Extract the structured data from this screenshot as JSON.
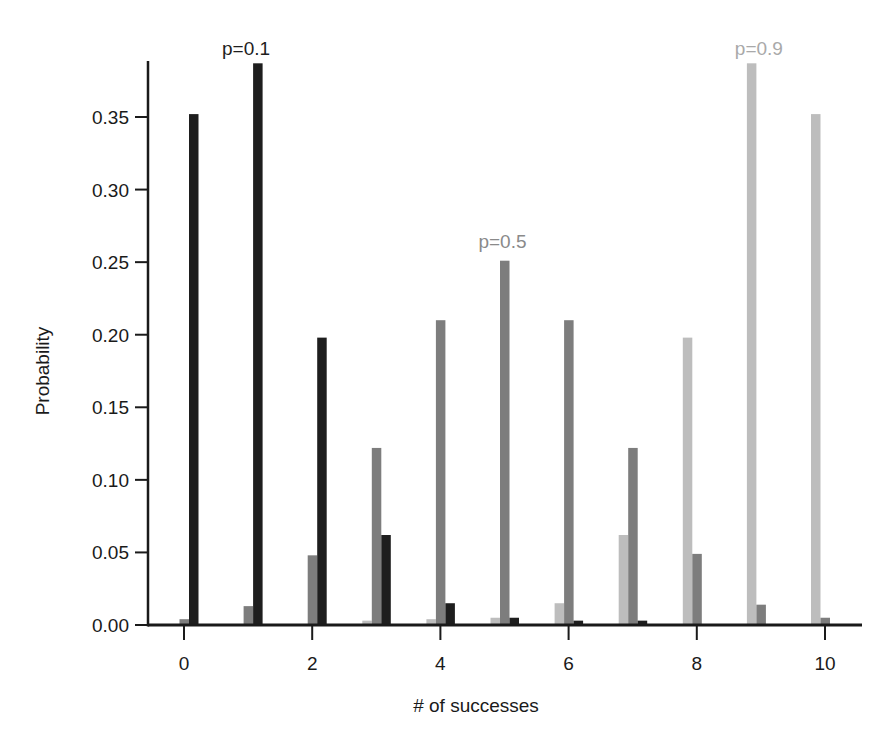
{
  "chart_data": {
    "type": "bar",
    "title": "",
    "xlabel": "# of successes",
    "ylabel": "Probability",
    "categories": [
      0,
      1,
      2,
      3,
      4,
      5,
      6,
      7,
      8,
      9,
      10
    ],
    "x_ticks": [
      "0",
      "2",
      "4",
      "6",
      "8",
      "10"
    ],
    "y_ticks": [
      "0.00",
      "0.05",
      "0.10",
      "0.15",
      "0.20",
      "0.25",
      "0.30",
      "0.35"
    ],
    "ylim": [
      0,
      0.388
    ],
    "xlim": [
      -0.55,
      10.6
    ],
    "grid": false,
    "legend": "inline annotations above peak bars",
    "series": [
      {
        "name": "p=0.9",
        "color": "#bdbdbd",
        "values": [
          0,
          0,
          0,
          0.003,
          0.004,
          0.005,
          0.015,
          0.062,
          0.198,
          0.387,
          0.352
        ]
      },
      {
        "name": "p=0.5",
        "color": "#7d7d7d",
        "values": [
          0.004,
          0.013,
          0.048,
          0.122,
          0.21,
          0.251,
          0.21,
          0.122,
          0.049,
          0.014,
          0.005
        ]
      },
      {
        "name": "p=0.1",
        "color": "#1e1e1e",
        "values": [
          0.352,
          0.387,
          0.198,
          0.062,
          0.015,
          0.005,
          0.003,
          0.003,
          0,
          0,
          0
        ]
      }
    ],
    "annotations": [
      {
        "text": "p=0.1",
        "x": 1,
        "y": 0.395,
        "color": "#1e1e1e"
      },
      {
        "text": "p=0.5",
        "x": 5,
        "y": 0.262,
        "color": "#8a8a8a"
      },
      {
        "text": "p=0.9",
        "x": 9,
        "y": 0.395,
        "color": "#a9a9a9"
      }
    ]
  }
}
